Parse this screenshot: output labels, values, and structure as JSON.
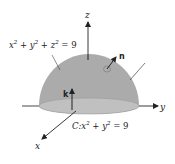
{
  "diagram": {
    "sphere_equation": {
      "base": "x",
      "parts": [
        "x",
        "2",
        " + y",
        "2",
        " + z",
        "2",
        " = 9"
      ]
    },
    "sphere_label": "x² + y² + z² = 9",
    "curve_label": "C: x² + y² = 9",
    "curve_prefix": "C:",
    "axes": {
      "x": "x",
      "y": "y",
      "z": "z"
    },
    "vectors": {
      "normal": "n",
      "k": "k"
    },
    "colors": {
      "dome": "#a9a9a9",
      "base": "#bdbdbd",
      "lines": "#222222"
    }
  }
}
